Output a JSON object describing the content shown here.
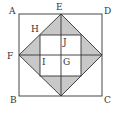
{
  "diagram": {
    "type": "geometry",
    "colors": {
      "stroke": "#333333",
      "shade": "#c8c8c8",
      "background": "#ffffff"
    },
    "labels": {
      "A": "A",
      "B": "B",
      "C": "C",
      "D": "D",
      "E": "E",
      "F": "F",
      "G": "G",
      "H": "H",
      "I": "I",
      "J": "J"
    }
  }
}
